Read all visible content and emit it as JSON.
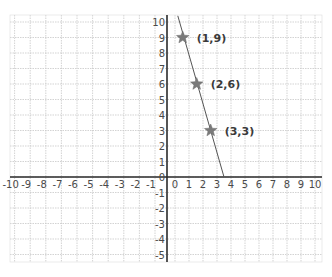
{
  "chart_data": {
    "type": "line",
    "title": "",
    "xlabel": "",
    "ylabel": "",
    "xlim": [
      -10,
      10
    ],
    "ylim": [
      -5,
      10
    ],
    "grid": true,
    "x_ticks": [
      -10,
      -9,
      -8,
      -7,
      -6,
      -5,
      -4,
      -3,
      -2,
      -1,
      0,
      1,
      2,
      3,
      4,
      5,
      6,
      7,
      8,
      9,
      10
    ],
    "y_ticks": [
      -5,
      -4,
      -3,
      -2,
      -1,
      0,
      1,
      2,
      3,
      4,
      5,
      6,
      7,
      8,
      9,
      10
    ],
    "series": [
      {
        "name": "line",
        "marker": "star",
        "points": [
          {
            "x": 1,
            "y": 9,
            "label": "(1,9)"
          },
          {
            "x": 2,
            "y": 6,
            "label": "(2,6)"
          },
          {
            "x": 3,
            "y": 3,
            "label": "(3,3)"
          }
        ],
        "line_extent": {
          "from": {
            "x": 0.2,
            "y": 10.4
          },
          "to": {
            "x": 3.5,
            "y": 0
          }
        }
      }
    ],
    "colors": {
      "grid": "#c8c8c8",
      "axis": "#2a2a2a",
      "line": "#555555",
      "marker": "#7a7a7a"
    }
  }
}
